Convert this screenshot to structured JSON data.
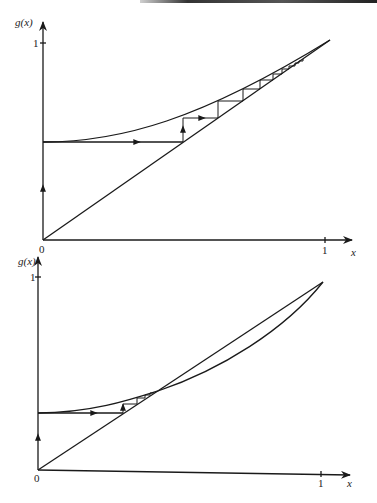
{
  "figure": {
    "panels": [
      {
        "id": "top",
        "y_label": "g(x)",
        "x_label": "x",
        "origin_label": "0",
        "y_tick_label": "1",
        "x_tick_label": "1",
        "description": "Cobweb iteration converging along g(x)=x toward fixed point at x=1; curve above diagonal, tangent at (1,1)"
      },
      {
        "id": "bottom",
        "y_label": "g(x)",
        "x_label": "x",
        "origin_label": "0",
        "y_tick_label": "1",
        "x_tick_label": "1",
        "description": "Cobweb iteration converging to a stable fixed point where curve crosses diagonal (~x=0.4); second intersection at x=1"
      }
    ]
  },
  "colors": {
    "ink": "#1a1a1a",
    "background": "#ffffff"
  }
}
